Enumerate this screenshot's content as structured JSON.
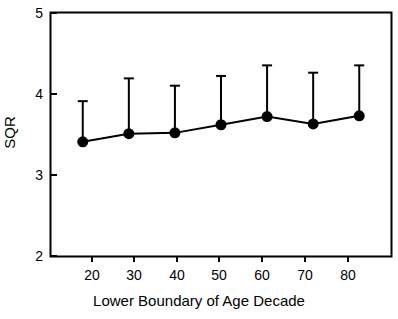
{
  "chart_data": {
    "type": "line",
    "title": "",
    "xlabel": "Lower Boundary of Age Decade",
    "ylabel": "SQR",
    "x": [
      20,
      30,
      40,
      50,
      60,
      70,
      80
    ],
    "xtick_labels": [
      "20",
      "30",
      "40",
      "50",
      "60",
      "70",
      "80"
    ],
    "ytick_labels": [
      "2",
      "3",
      "4",
      "5"
    ],
    "yticks": [
      2,
      3,
      4,
      5
    ],
    "xlim": [
      13,
      87
    ],
    "ylim": [
      2,
      5
    ],
    "grid": false,
    "legend": "none",
    "series": [
      {
        "name": "SQR",
        "values": [
          3.41,
          3.51,
          3.52,
          3.62,
          3.72,
          3.63,
          3.73
        ],
        "error_upper": [
          3.91,
          4.19,
          4.1,
          4.22,
          4.35,
          4.26,
          4.35
        ],
        "error_bar_style": "upper-only-with-cap",
        "marker": "filled-circle",
        "color": "#000000"
      }
    ],
    "points": [
      {
        "x": 20,
        "y": 3.41,
        "upper": 3.91
      },
      {
        "x": 30,
        "y": 3.51,
        "upper": 4.19
      },
      {
        "x": 40,
        "y": 3.52,
        "upper": 4.1
      },
      {
        "x": 50,
        "y": 3.62,
        "upper": 4.22
      },
      {
        "x": 60,
        "y": 3.72,
        "upper": 4.35
      },
      {
        "x": 70,
        "y": 3.63,
        "upper": 4.26
      },
      {
        "x": 80,
        "y": 3.73,
        "upper": 4.35
      }
    ]
  },
  "style": {
    "frame_color": "#000000",
    "series_color": "#000000",
    "background": "#ffffff"
  }
}
